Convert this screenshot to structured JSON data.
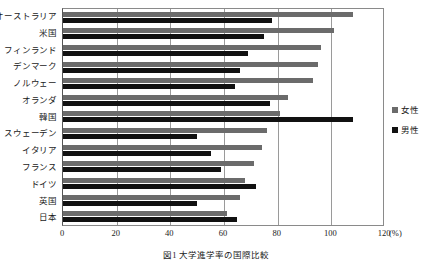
{
  "caption": "図1 大学進学率の国際比較",
  "legend": {
    "position": "right",
    "items": [
      {
        "label": "女性",
        "color": "#6b6b6b",
        "key": "female"
      },
      {
        "label": "男性",
        "color": "#111111",
        "key": "male"
      }
    ]
  },
  "axis": {
    "unit": "(%)",
    "ticks": [
      "0",
      "20",
      "40",
      "60",
      "80",
      "100",
      "120"
    ]
  },
  "chart_data": {
    "type": "bar",
    "orientation": "horizontal",
    "title": "図1 大学進学率の国際比較",
    "xlabel": "(%)",
    "ylabel": "",
    "xlim": [
      0,
      120
    ],
    "xticks": [
      0,
      20,
      40,
      60,
      80,
      100,
      120
    ],
    "grid": true,
    "legend_position": "right",
    "categories": [
      "オーストラリア",
      "米国",
      "フィンランド",
      "デンマーク",
      "ノルウェー",
      "オランダ",
      "韓国",
      "スウェーデン",
      "イタリア",
      "フランス",
      "ドイツ",
      "英国",
      "日本"
    ],
    "series": [
      {
        "name": "女性",
        "color": "#6b6b6b",
        "values": [
          108,
          101,
          96,
          95,
          93,
          84,
          81,
          76,
          74,
          71,
          68,
          66,
          61
        ]
      },
      {
        "name": "男性",
        "color": "#111111",
        "values": [
          78,
          75,
          69,
          66,
          64,
          77,
          108,
          50,
          55,
          59,
          72,
          50,
          65
        ]
      }
    ]
  }
}
